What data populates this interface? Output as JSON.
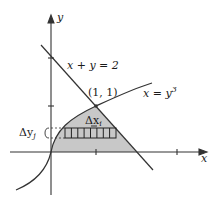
{
  "figure": {
    "axes": {
      "x_label": "x",
      "y_label": "y"
    },
    "curves": [
      {
        "id": "line",
        "label": "x + y = 2"
      },
      {
        "id": "cubic",
        "label": "x = y",
        "label_exp": "3"
      }
    ],
    "intersection": {
      "label": "(1, 1)"
    },
    "strip": {
      "dx_label": "Δx",
      "dx_sub": "i",
      "dy_label": "Δy",
      "dy_sub": "j",
      "cells": 8
    },
    "colors": {
      "region_fill": "#c8c8c8",
      "stroke": "#333333"
    }
  }
}
